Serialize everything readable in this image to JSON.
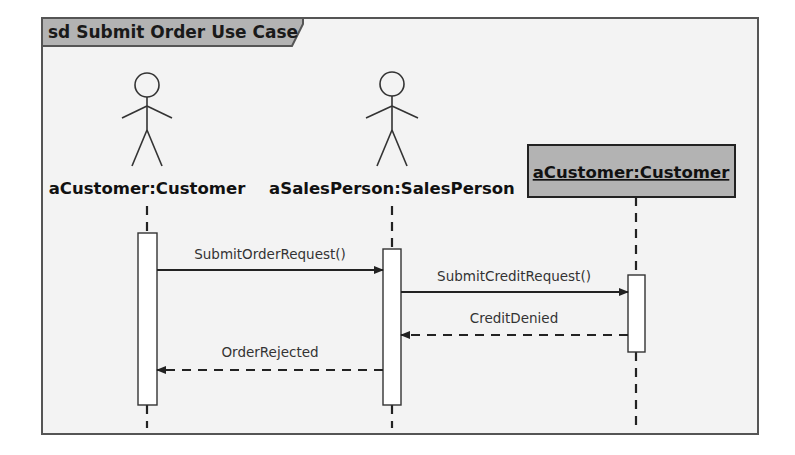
{
  "diagram": {
    "type": "sequence",
    "frame": {
      "title": "sd Submit Order Use Case",
      "tab_color": "#b3b3b3",
      "background": "#f3f3f3",
      "border_color": "#555555"
    },
    "participants": [
      {
        "kind": "actor",
        "label": "aCustomer:Customer",
        "x": 147
      },
      {
        "kind": "actor",
        "label": "aSalesPerson:SalesPerson",
        "x": 392
      },
      {
        "kind": "object",
        "label": "aCustomer:Customer",
        "x": 636,
        "fill": "#b3b3b3"
      }
    ],
    "messages": [
      {
        "label": "SubmitOrderRequest()",
        "from": 0,
        "to": 1,
        "style": "sync",
        "y": 270
      },
      {
        "label": "SubmitCreditRequest()",
        "from": 1,
        "to": 2,
        "style": "sync",
        "y": 292
      },
      {
        "label": "CreditDenied",
        "from": 2,
        "to": 1,
        "style": "return",
        "y": 335
      },
      {
        "label": "OrderRejected",
        "from": 1,
        "to": 0,
        "style": "return",
        "y": 370
      }
    ]
  }
}
